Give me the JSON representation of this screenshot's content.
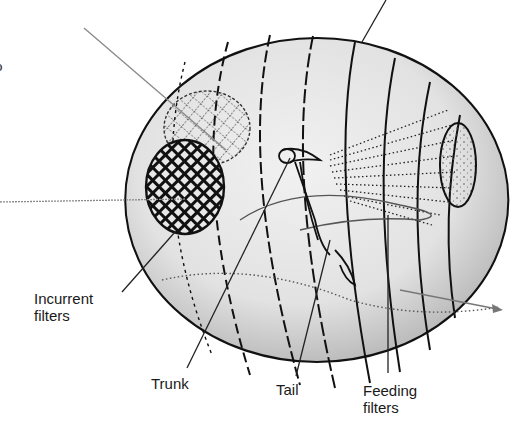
{
  "diagram": {
    "labels": [
      {
        "id": "incurrent",
        "text_line1": "Incurrent",
        "text_line2": "filters"
      },
      {
        "id": "trunk",
        "text_line1": "Trunk"
      },
      {
        "id": "tail",
        "text_line1": "Tail"
      },
      {
        "id": "feeding",
        "text_line1": "Feeding",
        "text_line2": "filters"
      }
    ],
    "edge_fragment": "o",
    "colors": {
      "ink": "#1a1a1a",
      "house_fill": "#e6e6e6",
      "leader_gray": "#777777",
      "background": "#ffffff"
    }
  }
}
